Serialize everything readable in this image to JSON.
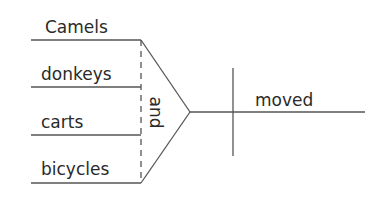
{
  "diagram": {
    "type": "sentence-diagram",
    "subjects": [
      "Camels",
      "donkeys",
      "carts",
      "bicycles"
    ],
    "conjunction": "and",
    "verb": "moved",
    "line_color": "#555555"
  }
}
